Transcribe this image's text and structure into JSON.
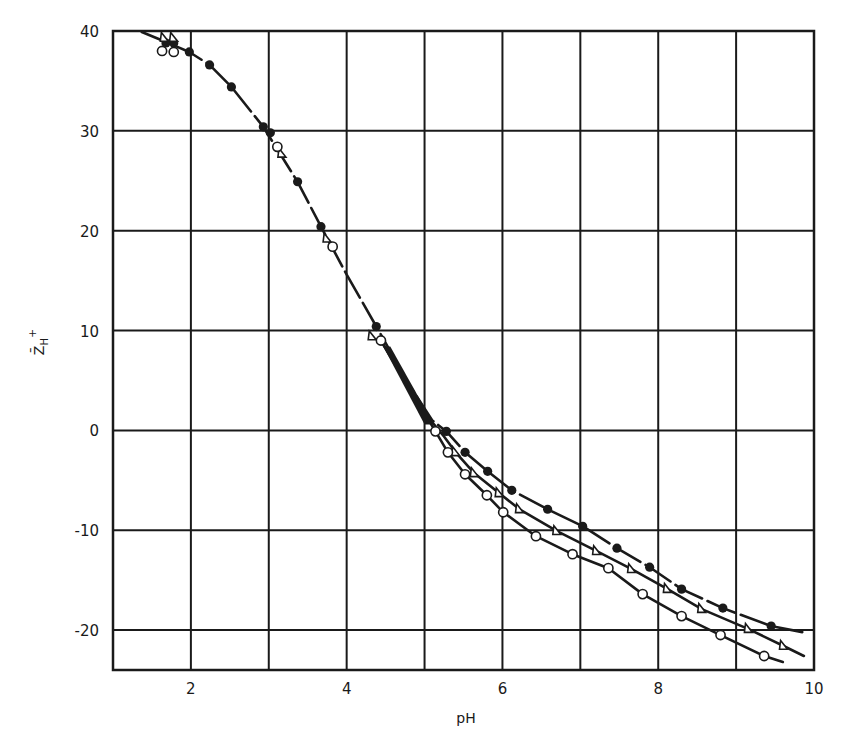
{
  "chart_data": {
    "type": "scatter",
    "title": "",
    "xlabel": "pH",
    "ylabel": "Z̄H+",
    "ylabel_parts": {
      "main": "Z̄",
      "sub": "H",
      "sup": "+"
    },
    "xlim": [
      1,
      10
    ],
    "ylim": [
      -24,
      40
    ],
    "x_ticks": [
      2,
      4,
      6,
      8,
      10
    ],
    "x_tick_labels": [
      "2",
      "4",
      "6",
      "8",
      "10"
    ],
    "y_ticks": [
      -20,
      -10,
      0,
      10,
      20,
      30,
      40
    ],
    "y_tick_labels": [
      "-20",
      "-10",
      "0",
      "10",
      "20",
      "30",
      "40"
    ],
    "x_gridlines": [
      2,
      3,
      4,
      5,
      6,
      7,
      8,
      9
    ],
    "y_gridlines": [
      -20,
      -10,
      0,
      10,
      20,
      30
    ],
    "grid": true,
    "legend": null,
    "series": [
      {
        "name": "filled circles",
        "marker": "filled-circle",
        "points": [
          [
            1.68,
            38.8
          ],
          [
            1.78,
            38.8
          ],
          [
            1.98,
            37.9
          ],
          [
            2.24,
            36.6
          ],
          [
            2.52,
            34.4
          ],
          [
            2.93,
            30.4
          ],
          [
            3.02,
            29.8
          ],
          [
            3.37,
            24.9
          ],
          [
            3.67,
            20.4
          ],
          [
            4.38,
            10.4
          ],
          [
            5.28,
            -0.1
          ],
          [
            5.52,
            -2.2
          ],
          [
            5.81,
            -4.1
          ],
          [
            6.12,
            -6.0
          ],
          [
            6.58,
            -7.9
          ],
          [
            7.03,
            -9.6
          ],
          [
            7.47,
            -11.8
          ],
          [
            7.89,
            -13.7
          ],
          [
            8.3,
            -15.9
          ],
          [
            8.83,
            -17.8
          ],
          [
            9.45,
            -19.6
          ]
        ],
        "curve": [
          [
            1.37,
            39.9
          ],
          [
            1.68,
            38.9
          ],
          [
            1.98,
            37.9
          ],
          [
            2.24,
            36.6
          ],
          [
            2.52,
            34.4
          ],
          [
            2.93,
            30.4
          ],
          [
            3.37,
            24.9
          ],
          [
            3.67,
            20.4
          ],
          [
            4.0,
            15.6
          ],
          [
            4.38,
            10.4
          ],
          [
            4.8,
            4.6
          ],
          [
            5.1,
            1.0
          ],
          [
            5.28,
            -0.1
          ],
          [
            5.52,
            -2.2
          ],
          [
            5.81,
            -4.1
          ],
          [
            6.12,
            -6.0
          ],
          [
            6.58,
            -7.9
          ],
          [
            7.03,
            -9.6
          ],
          [
            7.47,
            -11.8
          ],
          [
            7.89,
            -13.7
          ],
          [
            8.3,
            -15.9
          ],
          [
            8.83,
            -17.8
          ],
          [
            9.45,
            -19.6
          ],
          [
            9.85,
            -20.2
          ]
        ],
        "dashed": true
      },
      {
        "name": "open triangles",
        "marker": "open-triangle",
        "points": [
          [
            1.66,
            39.3
          ],
          [
            1.78,
            39.3
          ],
          [
            3.17,
            27.7
          ],
          [
            3.75,
            19.2
          ],
          [
            4.33,
            9.4
          ],
          [
            5.4,
            -2.2
          ],
          [
            5.64,
            -4.3
          ],
          [
            5.96,
            -6.3
          ],
          [
            6.22,
            -7.9
          ],
          [
            6.7,
            -10.1
          ],
          [
            7.21,
            -12.1
          ],
          [
            7.66,
            -13.9
          ],
          [
            8.12,
            -15.9
          ],
          [
            8.56,
            -17.9
          ],
          [
            9.16,
            -19.9
          ],
          [
            9.61,
            -21.6
          ]
        ],
        "curve": [
          [
            4.44,
            9.0
          ],
          [
            4.8,
            4.4
          ],
          [
            5.1,
            0.8
          ],
          [
            5.25,
            -0.6
          ],
          [
            5.4,
            -2.2
          ],
          [
            5.64,
            -4.3
          ],
          [
            5.96,
            -6.3
          ],
          [
            6.22,
            -7.9
          ],
          [
            6.7,
            -10.1
          ],
          [
            7.21,
            -12.1
          ],
          [
            7.66,
            -13.9
          ],
          [
            8.12,
            -15.9
          ],
          [
            8.56,
            -17.9
          ],
          [
            9.16,
            -19.9
          ],
          [
            9.61,
            -21.6
          ],
          [
            9.87,
            -22.6
          ]
        ],
        "dashed": false
      },
      {
        "name": "open circles",
        "marker": "open-circle",
        "points": [
          [
            1.63,
            38.0
          ],
          [
            1.78,
            37.9
          ],
          [
            3.11,
            28.4
          ],
          [
            3.82,
            18.4
          ],
          [
            4.44,
            9.0
          ],
          [
            5.14,
            -0.1
          ],
          [
            5.3,
            -2.2
          ],
          [
            5.52,
            -4.4
          ],
          [
            5.8,
            -6.5
          ],
          [
            6.01,
            -8.2
          ],
          [
            6.43,
            -10.6
          ],
          [
            6.9,
            -12.4
          ],
          [
            7.36,
            -13.8
          ],
          [
            7.8,
            -16.4
          ],
          [
            8.3,
            -18.6
          ],
          [
            8.8,
            -20.5
          ],
          [
            9.36,
            -22.6
          ]
        ],
        "curve": [
          [
            4.44,
            9.0
          ],
          [
            4.8,
            4.2
          ],
          [
            5.14,
            -0.1
          ],
          [
            5.3,
            -2.2
          ],
          [
            5.52,
            -4.4
          ],
          [
            5.8,
            -6.5
          ],
          [
            6.01,
            -8.2
          ],
          [
            6.43,
            -10.6
          ],
          [
            6.9,
            -12.4
          ],
          [
            7.36,
            -13.8
          ],
          [
            7.8,
            -16.4
          ],
          [
            8.3,
            -18.6
          ],
          [
            8.8,
            -20.5
          ],
          [
            9.36,
            -22.6
          ],
          [
            9.6,
            -23.2
          ]
        ],
        "dashed": false
      }
    ],
    "annotations": []
  },
  "style": {
    "ink_color": "#1a1a1a",
    "background": "#ffffff",
    "plot_box": {
      "left": 113,
      "top": 31,
      "right": 814,
      "bottom": 670
    }
  }
}
